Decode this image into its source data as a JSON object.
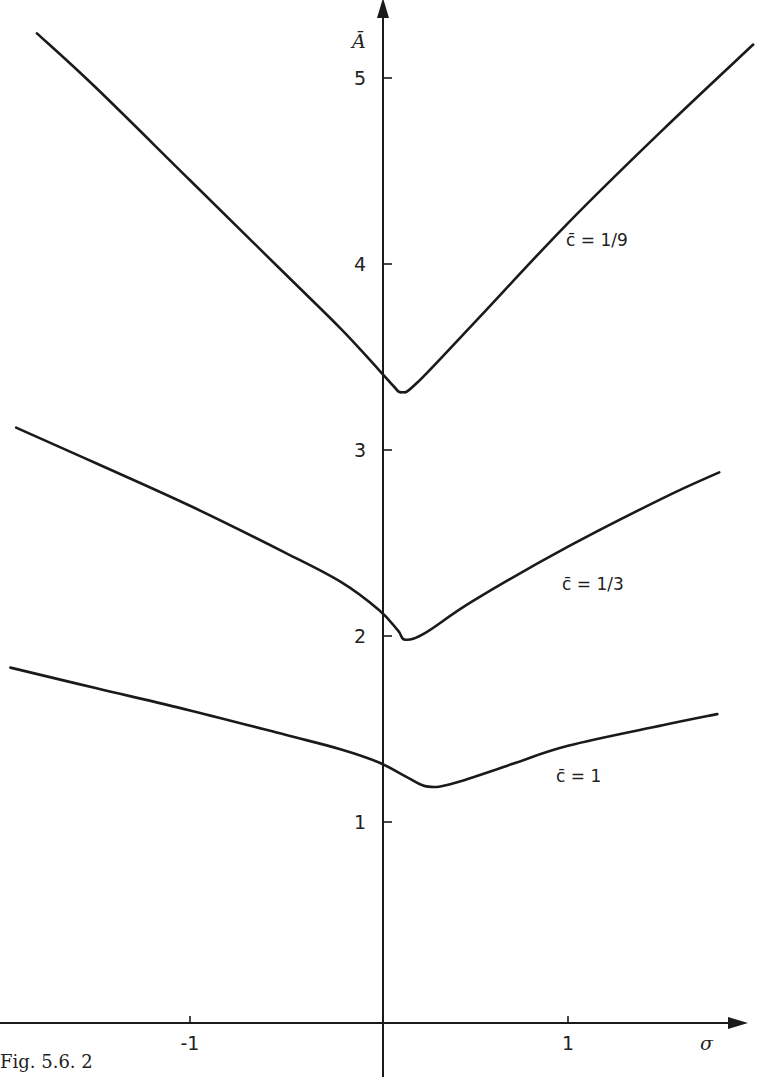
{
  "figure": {
    "caption": "Fig. 5.6. 2"
  },
  "chart_data": {
    "type": "line",
    "title": "",
    "xlabel": "σ",
    "ylabel": "Ā",
    "xlim": [
      -2.0,
      2.0
    ],
    "ylim": [
      0,
      5.5
    ],
    "x_ticks": [
      -1,
      1
    ],
    "x_tick_labels": [
      "-1",
      "1"
    ],
    "y_ticks": [
      1,
      2,
      3,
      4,
      5
    ],
    "y_tick_labels": [
      "1",
      "2",
      "3",
      "4",
      "5"
    ],
    "grid": false,
    "legend": "inline labels next to curves",
    "series": [
      {
        "name": "c̄ = 1/9",
        "label": "c̄ = 1/9",
        "x": [
          -1.81,
          -1.5,
          -1.0,
          -0.5,
          -0.2,
          0.0,
          0.08,
          0.12,
          0.2,
          0.5,
          1.0,
          1.5,
          1.98
        ],
        "y": [
          5.24,
          4.95,
          4.45,
          3.95,
          3.65,
          3.43,
          3.34,
          3.31,
          3.36,
          3.68,
          4.22,
          4.72,
          5.18
        ]
      },
      {
        "name": "c̄ = 1/3",
        "label": "c̄ = 1/3",
        "x": [
          -1.92,
          -1.5,
          -1.0,
          -0.5,
          -0.2,
          0.0,
          0.1,
          0.14,
          0.25,
          0.5,
          1.0,
          1.5,
          1.8
        ],
        "y": [
          3.12,
          2.93,
          2.7,
          2.45,
          2.29,
          2.14,
          2.03,
          1.98,
          2.02,
          2.19,
          2.48,
          2.74,
          2.88
        ]
      },
      {
        "name": "c̄ = 1",
        "label": "c̄ = 1",
        "x": [
          -1.95,
          -1.5,
          -1.0,
          -0.5,
          -0.2,
          0.0,
          0.15,
          0.26,
          0.4,
          0.7,
          1.0,
          1.5,
          1.79
        ],
        "y": [
          1.83,
          1.72,
          1.6,
          1.47,
          1.39,
          1.32,
          1.24,
          1.19,
          1.21,
          1.31,
          1.41,
          1.52,
          1.58
        ]
      }
    ]
  },
  "labels": {
    "series_0": "c̄ = 1/9",
    "series_1": "c̄ = 1/3",
    "series_2": "c̄ = 1",
    "x_axis": "σ",
    "y_axis": "Ā"
  }
}
